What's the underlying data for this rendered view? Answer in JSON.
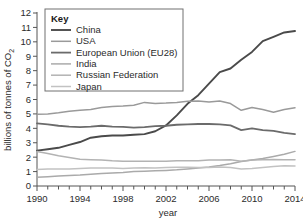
{
  "chart_data": {
    "type": "line",
    "title": "",
    "xlabel": "year",
    "ylabel": "billions of tonnes of CO",
    "ylabel_sub": "2",
    "xlim": [
      1990,
      2014
    ],
    "ylim": [
      0,
      12
    ],
    "ytick_labels": [
      "0",
      "1",
      "2",
      "3",
      "4",
      "5",
      "6",
      "7",
      "8",
      "9",
      "10",
      "11",
      "12"
    ],
    "xtick_labels": [
      "1990",
      "1994",
      "1998",
      "2002",
      "2006",
      "2010",
      "2014"
    ],
    "xticks_minor_step": 1,
    "grid": false,
    "legend_position": "inside-top-left",
    "legend_title": "Key",
    "x": [
      1990,
      1991,
      1992,
      1993,
      1994,
      1995,
      1996,
      1997,
      1998,
      1999,
      2000,
      2001,
      2002,
      2003,
      2004,
      2005,
      2006,
      2007,
      2008,
      2009,
      2010,
      2011,
      2012,
      2013,
      2014
    ],
    "series": [
      {
        "name": "China",
        "color": "#4a4a4a",
        "width": 1.9,
        "values": [
          2.45,
          2.55,
          2.65,
          2.85,
          3.05,
          3.35,
          3.45,
          3.5,
          3.5,
          3.55,
          3.6,
          3.8,
          4.2,
          4.9,
          5.7,
          6.3,
          7.1,
          7.9,
          8.15,
          8.75,
          9.3,
          10.05,
          10.35,
          10.65,
          10.75
        ]
      },
      {
        "name": "USA",
        "color": "#9a9a9a",
        "width": 1.5,
        "values": [
          4.98,
          5.0,
          5.08,
          5.18,
          5.25,
          5.3,
          5.45,
          5.52,
          5.55,
          5.6,
          5.8,
          5.72,
          5.75,
          5.8,
          5.88,
          5.9,
          5.82,
          5.9,
          5.72,
          5.25,
          5.45,
          5.3,
          5.12,
          5.3,
          5.42
        ]
      },
      {
        "name": "European Union (EU28)",
        "color": "#6b6b6b",
        "width": 1.8,
        "values": [
          4.35,
          4.28,
          4.18,
          4.12,
          4.08,
          4.12,
          4.18,
          4.12,
          4.1,
          4.05,
          4.08,
          4.15,
          4.18,
          4.25,
          4.28,
          4.3,
          4.3,
          4.28,
          4.2,
          3.88,
          4.0,
          3.88,
          3.82,
          3.68,
          3.6
        ]
      },
      {
        "name": "India",
        "color": "#aaaaaa",
        "width": 1.5,
        "values": [
          0.6,
          0.65,
          0.69,
          0.72,
          0.76,
          0.82,
          0.87,
          0.91,
          0.94,
          1.0,
          1.02,
          1.05,
          1.08,
          1.12,
          1.18,
          1.25,
          1.32,
          1.42,
          1.55,
          1.7,
          1.8,
          1.9,
          2.05,
          2.2,
          2.4
        ]
      },
      {
        "name": "Russian Federation",
        "color": "#b3b3b3",
        "width": 1.5,
        "values": [
          2.4,
          2.25,
          2.1,
          1.98,
          1.85,
          1.82,
          1.8,
          1.75,
          1.72,
          1.72,
          1.72,
          1.72,
          1.72,
          1.75,
          1.76,
          1.76,
          1.8,
          1.8,
          1.82,
          1.72,
          1.8,
          1.82,
          1.84,
          1.82,
          1.82
        ]
      },
      {
        "name": "Japan",
        "color": "#c2c2c2",
        "width": 1.5,
        "values": [
          1.15,
          1.18,
          1.18,
          1.18,
          1.22,
          1.24,
          1.25,
          1.25,
          1.22,
          1.24,
          1.26,
          1.25,
          1.28,
          1.3,
          1.3,
          1.28,
          1.28,
          1.32,
          1.28,
          1.18,
          1.22,
          1.28,
          1.35,
          1.4,
          1.38
        ]
      }
    ]
  },
  "axes": {
    "y_title": "billions of tonnes of CO",
    "y_title_sub": "2",
    "x_title": "year"
  },
  "legend": {
    "title": "Key",
    "items": [
      {
        "label": "China",
        "color": "#4a4a4a",
        "width": 1.9
      },
      {
        "label": "USA",
        "color": "#9a9a9a",
        "width": 1.5
      },
      {
        "label": "European Union (EU28)",
        "color": "#6b6b6b",
        "width": 1.8
      },
      {
        "label": "India",
        "color": "#aaaaaa",
        "width": 1.5
      },
      {
        "label": "Russian Federation",
        "color": "#b3b3b3",
        "width": 1.5
      },
      {
        "label": "Japan",
        "color": "#c2c2c2",
        "width": 1.5
      }
    ]
  }
}
